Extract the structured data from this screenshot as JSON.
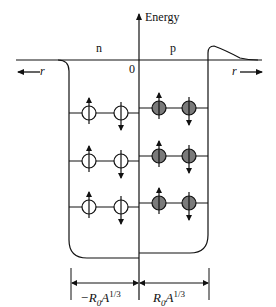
{
  "diagram": {
    "axis": {
      "vertical_label": "Energy",
      "origin_label": "0",
      "left_r_label": "r",
      "right_r_label": "r"
    },
    "wells": {
      "neutron": {
        "label": "n",
        "fill": "open",
        "levels": 3,
        "particles_per_level": 2
      },
      "proton": {
        "label": "p",
        "fill": "filled",
        "levels": 3,
        "particles_per_level": 2,
        "fill_color": "#7a7a7a"
      }
    },
    "dimensions": {
      "left": "−R₀A¹ᐟ³",
      "left_main": "−R",
      "left_sub": "0",
      "left_A": "A",
      "left_sup": "1/3",
      "right_main": "R",
      "right_sub": "0",
      "right_A": "A",
      "right_sup": "1/3"
    },
    "colors": {
      "line": "#111111",
      "proton_fill": "#7a7a7a",
      "background": "#ffffff"
    }
  }
}
